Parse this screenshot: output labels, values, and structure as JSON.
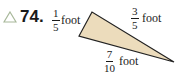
{
  "problem": {
    "number": "74.",
    "marker_icon": "triangle-outline-icon",
    "marker_color": "#a8b89a"
  },
  "figure": {
    "fill_color": "#ecdcbc",
    "stroke_color": "#222222",
    "sides": [
      {
        "numerator": "1",
        "denominator": "5",
        "unit": "foot"
      },
      {
        "numerator": "3",
        "denominator": "5",
        "unit": "foot"
      },
      {
        "numerator": "7",
        "denominator": "10",
        "unit": "foot"
      }
    ]
  }
}
